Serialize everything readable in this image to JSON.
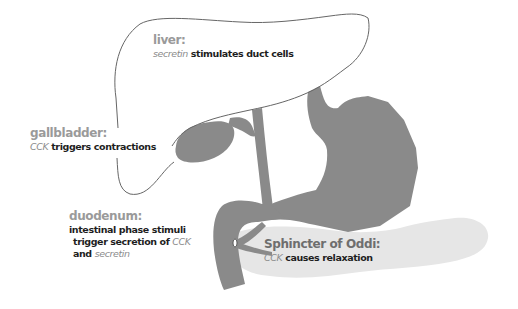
{
  "diagram": {
    "colors": {
      "organ_fill": "#8a8a8a",
      "pancreas_fill": "#e6e6e6",
      "liver_outline": "#666666",
      "label_title": "#9a9a9a",
      "label_body": "#1e1e1e",
      "hormone_text": "#8c8c8c",
      "sphincter_title": "#6e6e6e"
    },
    "labels": {
      "liver": {
        "title": "liver:",
        "hormone": "secretin",
        "text": " stimulates duct cells"
      },
      "gallbladder": {
        "title": "gallbladder:",
        "hormone": "CCK",
        "text": " triggers contractions"
      },
      "duodenum": {
        "title": "duodenum:",
        "line1": "intestinal phase stimuli",
        "line2_text": "trigger secretion of ",
        "line2_hormone": "CCK",
        "line3_text": "and ",
        "line3_hormone": "secretin"
      },
      "sphincter": {
        "title": "Sphincter of Oddi:",
        "hormone": "CCK",
        "text": " causes relaxation"
      }
    }
  }
}
